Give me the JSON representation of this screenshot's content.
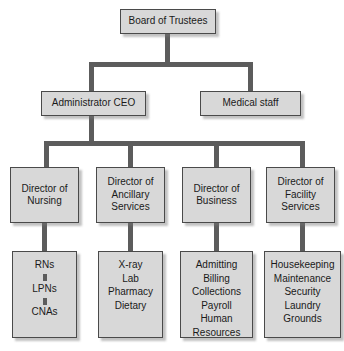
{
  "chart": {
    "type": "org-chart",
    "colors": {
      "node_fill": "#d8d8d8",
      "node_border": "#4a4a4a",
      "connector": "#5c5c5c",
      "text": "#1a1a1a",
      "background": "#ffffff"
    }
  },
  "nodes": {
    "board": {
      "label": "Board of Trustees"
    },
    "ceo": {
      "label": "Administrator CEO"
    },
    "medical_staff": {
      "label": "Medical staff"
    },
    "director_nursing": {
      "line1": "Director of",
      "line2": "Nursing"
    },
    "director_ancillary": {
      "line1": "Director of",
      "line2": "Ancillary",
      "line3": "Services"
    },
    "director_business": {
      "line1": "Director of",
      "line2": "Business"
    },
    "director_facility": {
      "line1": "Director of",
      "line2": "Facility",
      "line3": "Services"
    }
  },
  "staff_groups": {
    "nursing": {
      "ranked": true,
      "items": [
        "RNs",
        "LPNs",
        "CNAs"
      ]
    },
    "ancillary": {
      "ranked": false,
      "items": [
        "X-ray",
        "Lab",
        "Pharmacy",
        "Dietary"
      ]
    },
    "business": {
      "ranked": false,
      "items": [
        "Admitting",
        "Billing",
        "Collections",
        "Payroll",
        "Human",
        "Resources"
      ]
    },
    "facility": {
      "ranked": false,
      "items": [
        "Housekeeping",
        "Maintenance",
        "Security",
        "Laundry",
        "Grounds"
      ]
    }
  }
}
